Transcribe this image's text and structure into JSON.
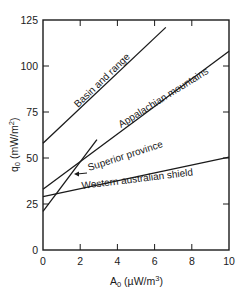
{
  "chart_data": {
    "type": "line",
    "title": "",
    "xlabel": "A0 (µW/m3)",
    "ylabel": "q0 (mW/m2)",
    "xlim": [
      0,
      10
    ],
    "ylim": [
      0,
      125
    ],
    "xticks": [
      0,
      2,
      4,
      6,
      8,
      10
    ],
    "yticks": [
      0,
      25,
      50,
      75,
      100,
      125
    ],
    "grid": false,
    "legend": "inline labels along lines",
    "series": [
      {
        "name": "Basin and range",
        "x": [
          0,
          6.6
        ],
        "y": [
          58,
          121
        ]
      },
      {
        "name": "Appalachian mountains",
        "x": [
          0,
          10
        ],
        "y": [
          33,
          108
        ]
      },
      {
        "name": "Superior province",
        "x": [
          0,
          2.9
        ],
        "y": [
          21,
          60
        ]
      },
      {
        "name": "Western australian shield",
        "x": [
          0,
          10
        ],
        "y": [
          29,
          50.5
        ]
      }
    ]
  },
  "labels": {
    "basin": "Basin and range",
    "appalachian": "Appalachian mountains",
    "superior": "Superior province",
    "western": "Western australian shield",
    "xlabel_main": "A",
    "xlabel_sub": "0",
    "xlabel_unit": " (µW/m",
    "xlabel_sup": "3",
    "xlabel_close": ")",
    "ylabel_main": "q",
    "ylabel_sub": "0",
    "ylabel_unit": " (mW/m",
    "ylabel_sup": "2",
    "ylabel_close": ")"
  }
}
